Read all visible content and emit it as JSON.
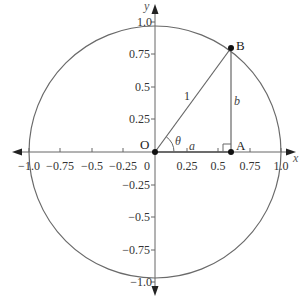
{
  "diagram": {
    "type": "unit-circle",
    "colors": {
      "line": "#555555",
      "axis": "#666666",
      "point": "#111111",
      "text": "#333333"
    },
    "axes": {
      "x_label": "x",
      "y_label": "y",
      "x_ticks": [
        {
          "value": -1.0,
          "label": "−1.0"
        },
        {
          "value": -0.75,
          "label": "−0.75"
        },
        {
          "value": -0.5,
          "label": "−0.5"
        },
        {
          "value": -0.25,
          "label": "−0.25"
        },
        {
          "value": 0.25,
          "label": "0.25"
        },
        {
          "value": 0.5,
          "label": "0.5"
        },
        {
          "value": 0.75,
          "label": "0.75"
        },
        {
          "value": 1.0,
          "label": "1.0"
        }
      ],
      "y_ticks": [
        {
          "value": 1.0,
          "label": "1.0"
        },
        {
          "value": 0.75,
          "label": "0.75"
        },
        {
          "value": 0.5,
          "label": "0.5"
        },
        {
          "value": 0.25,
          "label": "0.25"
        },
        {
          "value": -0.25,
          "label": "−0.25"
        },
        {
          "value": -0.5,
          "label": "−0.5"
        },
        {
          "value": -0.75,
          "label": "−0.75"
        },
        {
          "value": -1.0,
          "label": "−1.0"
        }
      ],
      "origin_label": "0"
    },
    "circle": {
      "center": [
        0,
        0
      ],
      "radius": 1
    },
    "points": {
      "O": {
        "label": "O",
        "x": 0,
        "y": 0
      },
      "A": {
        "label": "A",
        "x": 0.6,
        "y": 0
      },
      "B": {
        "label": "B",
        "x": 0.6,
        "y": 0.8
      }
    },
    "segment_labels": {
      "hypotenuse": "1",
      "adjacent": "a",
      "opposite": "b",
      "angle": "θ"
    }
  }
}
